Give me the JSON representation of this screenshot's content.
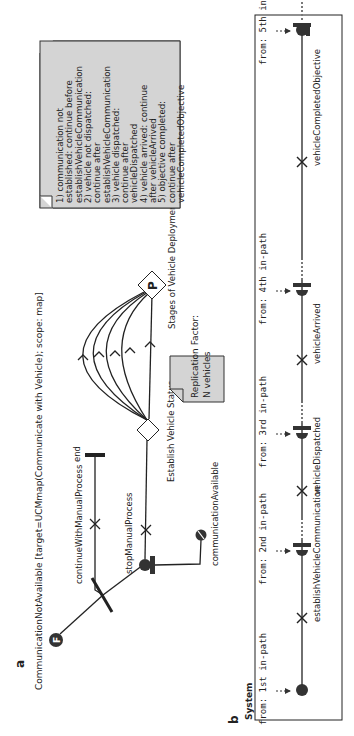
{
  "panel_a": {
    "label": "a",
    "title": "CommunicationNotAvailable [target=UCMmap(Communicate with Vehicle); scope: map]",
    "start_icon_letter": "F",
    "labels": {
      "continue_path": "continueWithManualProcess",
      "end": "end",
      "stop_path": "stopManualProcess",
      "comm_available": "communicationAvailable",
      "establish_stub": "Establish Vehicle Status",
      "stages_stub": "Stages of Vehicle Deployment",
      "stages_letter": "P"
    },
    "replication_note": [
      "Replication Factor:",
      "N vehicles"
    ],
    "continuation_note": [
      "1) communication not",
      "established: continue before",
      "establishVehicleCommunication",
      "2) vehicle not dispatched:",
      "continue after",
      "establishVehicleCommunication",
      "3) vehicle dispatched:",
      "continue after",
      "vehicleDispatched",
      "4) vehicle arrived: continue",
      "after vehicleArrived",
      "5) objective completed:",
      "continue after",
      "vehicleCompletedObjective"
    ]
  },
  "panel_b": {
    "label": "b",
    "component": "System",
    "in_paths": [
      "from: 1st in-path",
      "from: 2nd in-path",
      "from: 3rd in-path",
      "from: 4th in-path",
      "from: 5th in-path"
    ],
    "responsibilities": [
      "establishVehicleCommunication",
      "vehicleDispatched",
      "vehicleArrived",
      "vehicleCompletedObjective"
    ]
  },
  "colors": {
    "stroke": "#222222",
    "note_fill": "#d4d4d4",
    "fill_dark": "#333333"
  }
}
